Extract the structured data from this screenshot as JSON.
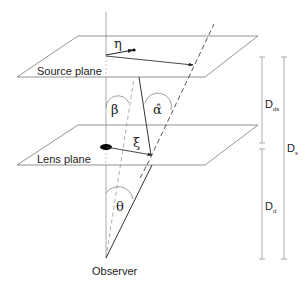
{
  "diagram": {
    "planes": {
      "source": "Source plane",
      "lens": "Lens plane"
    },
    "observer": "Observer",
    "angles": {
      "eta": "η",
      "beta": "β",
      "alpha_hat": "α̂",
      "xi": "ξ",
      "theta": "θ"
    },
    "distances": {
      "dds": {
        "main": "D",
        "sub": "ds"
      },
      "ds": {
        "main": "D",
        "sub": "s"
      },
      "dd": {
        "main": "D",
        "sub": "d"
      }
    },
    "colors": {
      "line": "#555555",
      "bold_line": "#333333",
      "dashed": "#888888",
      "lens_mass": "#000000"
    }
  }
}
